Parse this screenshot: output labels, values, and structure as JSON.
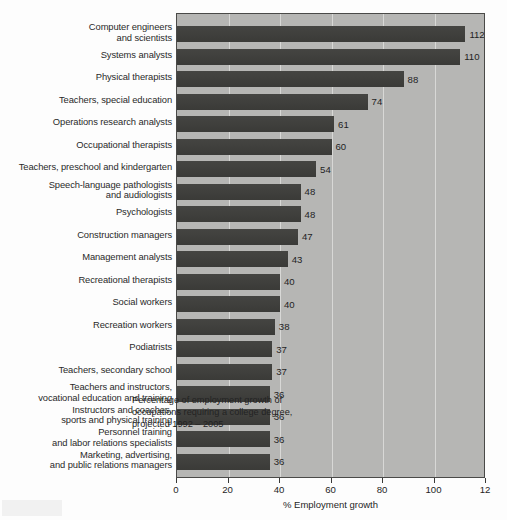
{
  "chart_data": {
    "type": "bar",
    "orientation": "horizontal",
    "title": "",
    "annotation": "Percentage of employment growth of\noccupations requiring a college degree,\nprojected 1992 – 2005",
    "xlabel": "% Employment growth",
    "ylabel": "",
    "xlim": [
      0,
      120
    ],
    "xticks": [
      0,
      20,
      40,
      60,
      80,
      100,
      120
    ],
    "xtick_labels": [
      "0",
      "20",
      "40",
      "60",
      "80",
      "100",
      "12"
    ],
    "grid": "vertical",
    "legend": "none",
    "bar_color": "#3e3e3b",
    "plot_background": "#b6b6b4",
    "categories": [
      "Computer engineers\nand scientists",
      "Systems analysts",
      "Physical therapists",
      "Teachers, special education",
      "Operations research analysts",
      "Occupational therapists",
      "Teachers, preschool and kindergarten",
      "Speech-language pathologists\nand audiologists",
      "Psychologists",
      "Construction managers",
      "Management analysts",
      "Recreational therapists",
      "Social workers",
      "Recreation workers",
      "Podiatrists",
      "Teachers, secondary school",
      "Teachers and instructors,\nvocational education and training",
      "Instructors and coaches,\nsports and physical training",
      "Personnel training\nand labor relations specialists",
      "Marketing, advertising,\nand public relations managers"
    ],
    "values": [
      112,
      110,
      88,
      74,
      61,
      60,
      54,
      48,
      48,
      47,
      43,
      40,
      40,
      38,
      37,
      37,
      36,
      36,
      36,
      36
    ],
    "value_labels": [
      "112",
      "110",
      "88",
      "74",
      "61",
      "60",
      "54",
      "48",
      "48",
      "47",
      "43",
      "40",
      "40",
      "38",
      "37",
      "37",
      "36",
      "36",
      "36",
      "36"
    ]
  }
}
